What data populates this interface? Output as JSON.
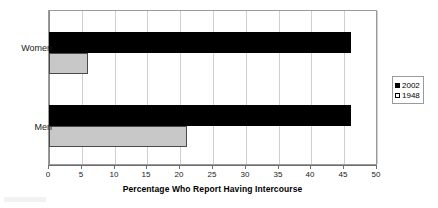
{
  "chart_data": {
    "type": "bar",
    "orientation": "horizontal",
    "title": "",
    "subtitle": "",
    "xlabel": "Percentage Who Report Having Intercourse",
    "ylabel": "",
    "categories": [
      "Women",
      "Men"
    ],
    "series": [
      {
        "name": "2002",
        "values": [
          46,
          46
        ],
        "color": "#000000"
      },
      {
        "name": "1948",
        "values": [
          6,
          21
        ],
        "color": "#c8c8c8"
      }
    ],
    "xlim": [
      0,
      50
    ],
    "xticks": [
      0,
      5,
      10,
      15,
      20,
      25,
      30,
      35,
      40,
      45,
      50
    ],
    "xtick_labels": [
      "0",
      "5",
      "10",
      "15",
      "20",
      "25",
      "30",
      "35",
      "40",
      "45",
      "50"
    ],
    "grid": "vertical",
    "legend_position": "right",
    "legend_entries": [
      {
        "label": "2002",
        "swatch": "filled-square"
      },
      {
        "label": "1948",
        "swatch": "outline-square"
      }
    ]
  },
  "axis": {
    "x_title": "Percentage Who Report Having Intercourse",
    "ticks": [
      "0",
      "5",
      "10",
      "15",
      "20",
      "25",
      "30",
      "35",
      "40",
      "45",
      "50"
    ]
  },
  "categories": {
    "women": "Women",
    "men": "Men"
  },
  "legend": {
    "series_2002": "2002",
    "series_1948": "1948"
  }
}
